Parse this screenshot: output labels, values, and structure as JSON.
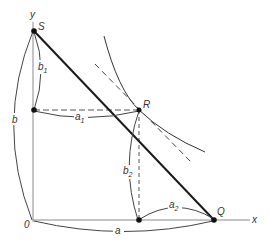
{
  "diagram": {
    "title": "",
    "colors": {
      "line": "#222222",
      "axis": "#888888",
      "brace": "#444444",
      "label": "#333333"
    },
    "axes": {
      "x_label": "x",
      "y_label": "y",
      "origin_label": "0"
    },
    "points": [
      {
        "id": "S",
        "label": "S"
      },
      {
        "id": "R",
        "label": "R"
      },
      {
        "id": "Q",
        "label": "Q"
      }
    ],
    "dimensions": {
      "a": {
        "main": "a",
        "sub": ""
      },
      "a1": {
        "main": "a",
        "sub": "1"
      },
      "a2": {
        "main": "a",
        "sub": "2"
      },
      "b": {
        "main": "b",
        "sub": ""
      },
      "b1": {
        "main": "b",
        "sub": "1"
      },
      "b2": {
        "main": "b",
        "sub": "2"
      }
    },
    "elements": [
      "segment SQ through R",
      "curve tangent at R",
      "dashed tangent line at R",
      "dashed horizontal from y-axis to R",
      "dashed vertical from R to x-axis"
    ]
  }
}
